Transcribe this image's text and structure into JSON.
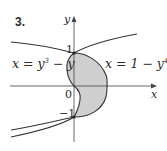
{
  "figure": {
    "problem_number": "3.",
    "axes": {
      "x_label": "x",
      "y_label": "y"
    },
    "ticks": {
      "y_pos": "1",
      "y_neg": "−1",
      "origin": "0"
    },
    "curves": [
      {
        "name": "cubic",
        "equation_lhs": "x = y",
        "equation_exp": "3",
        "equation_rhs": " − y"
      },
      {
        "name": "quartic",
        "equation_lhs": "x = 1 − y",
        "equation_exp": "4",
        "equation_rhs": ""
      }
    ],
    "colors": {
      "shade": "#cfcfcf",
      "curve": "#333333",
      "axis": "#555555"
    }
  }
}
